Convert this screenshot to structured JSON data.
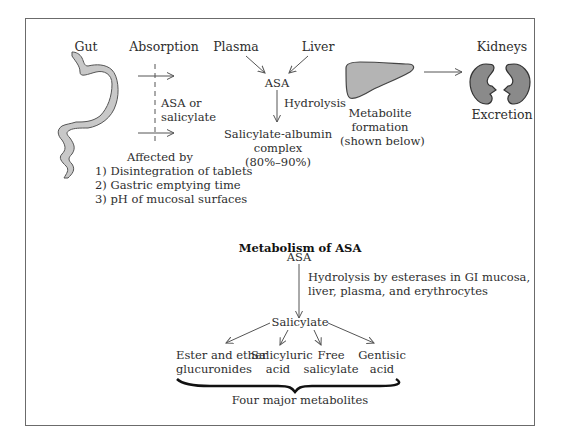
{
  "top_section": {
    "gut": {
      "label": "Gut"
    },
    "absorption": {
      "label": "Absorption",
      "crossing_label_line1": "ASA or",
      "crossing_label_line2": "salicylate",
      "affected_by_title": "Affected by",
      "factors": [
        "1) Disintegration of tablets",
        "2) Gastric emptying time",
        "3) pH of mucosal surfaces"
      ]
    },
    "plasma": {
      "label": "Plasma"
    },
    "liver": {
      "label": "Liver"
    },
    "asa_node": {
      "label": "ASA"
    },
    "hydrolysis": {
      "label": "Hydrolysis"
    },
    "albumin_complex": {
      "line1": "Salicylate-albumin",
      "line2": "complex",
      "line3": "(80%–90%)"
    },
    "metabolite_formation": {
      "line1": "Metabolite",
      "line2": "formation",
      "line3": "(shown below)"
    },
    "kidneys": {
      "label": "Kidneys",
      "caption": "Excretion"
    }
  },
  "metabolism_section": {
    "title": "Metabolism of ASA",
    "asa_node": "ASA",
    "hydrolysis_line1": "Hydrolysis by esterases in GI mucosa,",
    "hydrolysis_line2": "liver, plasma, and erythrocytes",
    "salicylate_node": "Salicylate",
    "metabolites": [
      {
        "line1": "Ester and ether",
        "line2": "glucuronides"
      },
      {
        "line1": "Salicyluric",
        "line2": "acid"
      },
      {
        "line1": "Free",
        "line2": "salicylate"
      },
      {
        "line1": "Gentisic",
        "line2": "acid"
      }
    ],
    "brace_label": "Four major metabolites"
  },
  "colors": {
    "organ_fill_light": "#c8c8c8",
    "organ_fill_liver": "#b4b4b4",
    "organ_fill_kidney": "#8a8a8a",
    "line": "#555555",
    "border": "#6b6b6b"
  }
}
